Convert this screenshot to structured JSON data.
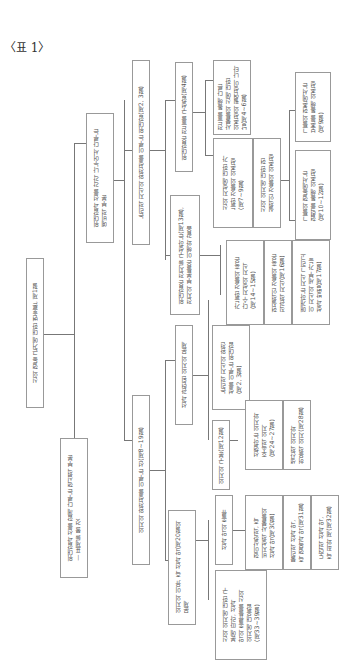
{
  "caption": "〈표 1〉",
  "root": "신의 행동 근거에 대한 변호론, 제1절",
  "level1": {
    "a": "위대함과 선을 함께 다루는 핵심적 부분\n— 표제를 볼 것",
    "b": "위대함과 선을 각각 나누어서 다루는\n예비적 부분",
    "c": "의지의 완전성을 이루는 선(제8~19절)",
    "d": "의지의 이유, 즉 선과 악(제20절의\n문제",
    "e": "신의 완전성을 이루는 위대함(제2, 3절)",
    "f": "논리적 지식의 완전성을 이루는 위대함(제2, 3절)"
  },
  "level2": {
    "power": "위대함은 전지를 구성하는(제13절),\n전지의 부분들은 이해와 같음",
    "goodness": "위대함은 전능을 구성함(제4절)",
    "will_related": "선과 관련된 의지의 문제",
    "will_division": "의지의 구분(제12절)",
    "logic_greatness": "논리적 지식의 완전\n성을 이루는 위대함\n(제2, 3절)",
    "will_evil": "선과 악의 종류",
    "will_reason": "신의 의지에 대한 구\n분에 따라, 선과\n악의 종류들을 신의\n의지에 대응함\n(제33~39절)"
  },
  "level3": {
    "n1": "가능한 것들의 혹은\n다수 지성의 지식\n(제14~15절)",
    "n2": "현실적인 것들의 혹은\n직관적 지식(제16절)",
    "n3": "매개하는 지식 그리고\n이 지식의 세부 가능\n성과 방법(제17절)",
    "n4": "신의 지성에 대한 가\n능한 것들의 의존성\n(제7~9절)",
    "n5": "신의 의지에 대한 현\n실적인 것들의 의존성",
    "n6": "전능을 통해 다른\n사물들의 신에 대한\n의존성의 필연성이 나타\n남(제4~6절)",
    "n7": "그들의 현존에서는\n보존을 통해 의존성\n(제9절)",
    "n8": "그들의 행동에서는\n협력을 통해 의존성\n(제10~12절)",
    "n9": "선행하는 의지와\n후속적 의지\n(제24~27절)",
    "n10": "생산적 의지와\n허용적 의지(제28절)",
    "n11": "형이상학적, 즉\n비지성적 사물들의\n선과 악(제30절)",
    "n12": "물리적 선과 악,\n즉 행복과 악(제31절)",
    "n13": "도덕적 선과 악,\n즉 죄와 제(제32절)"
  }
}
